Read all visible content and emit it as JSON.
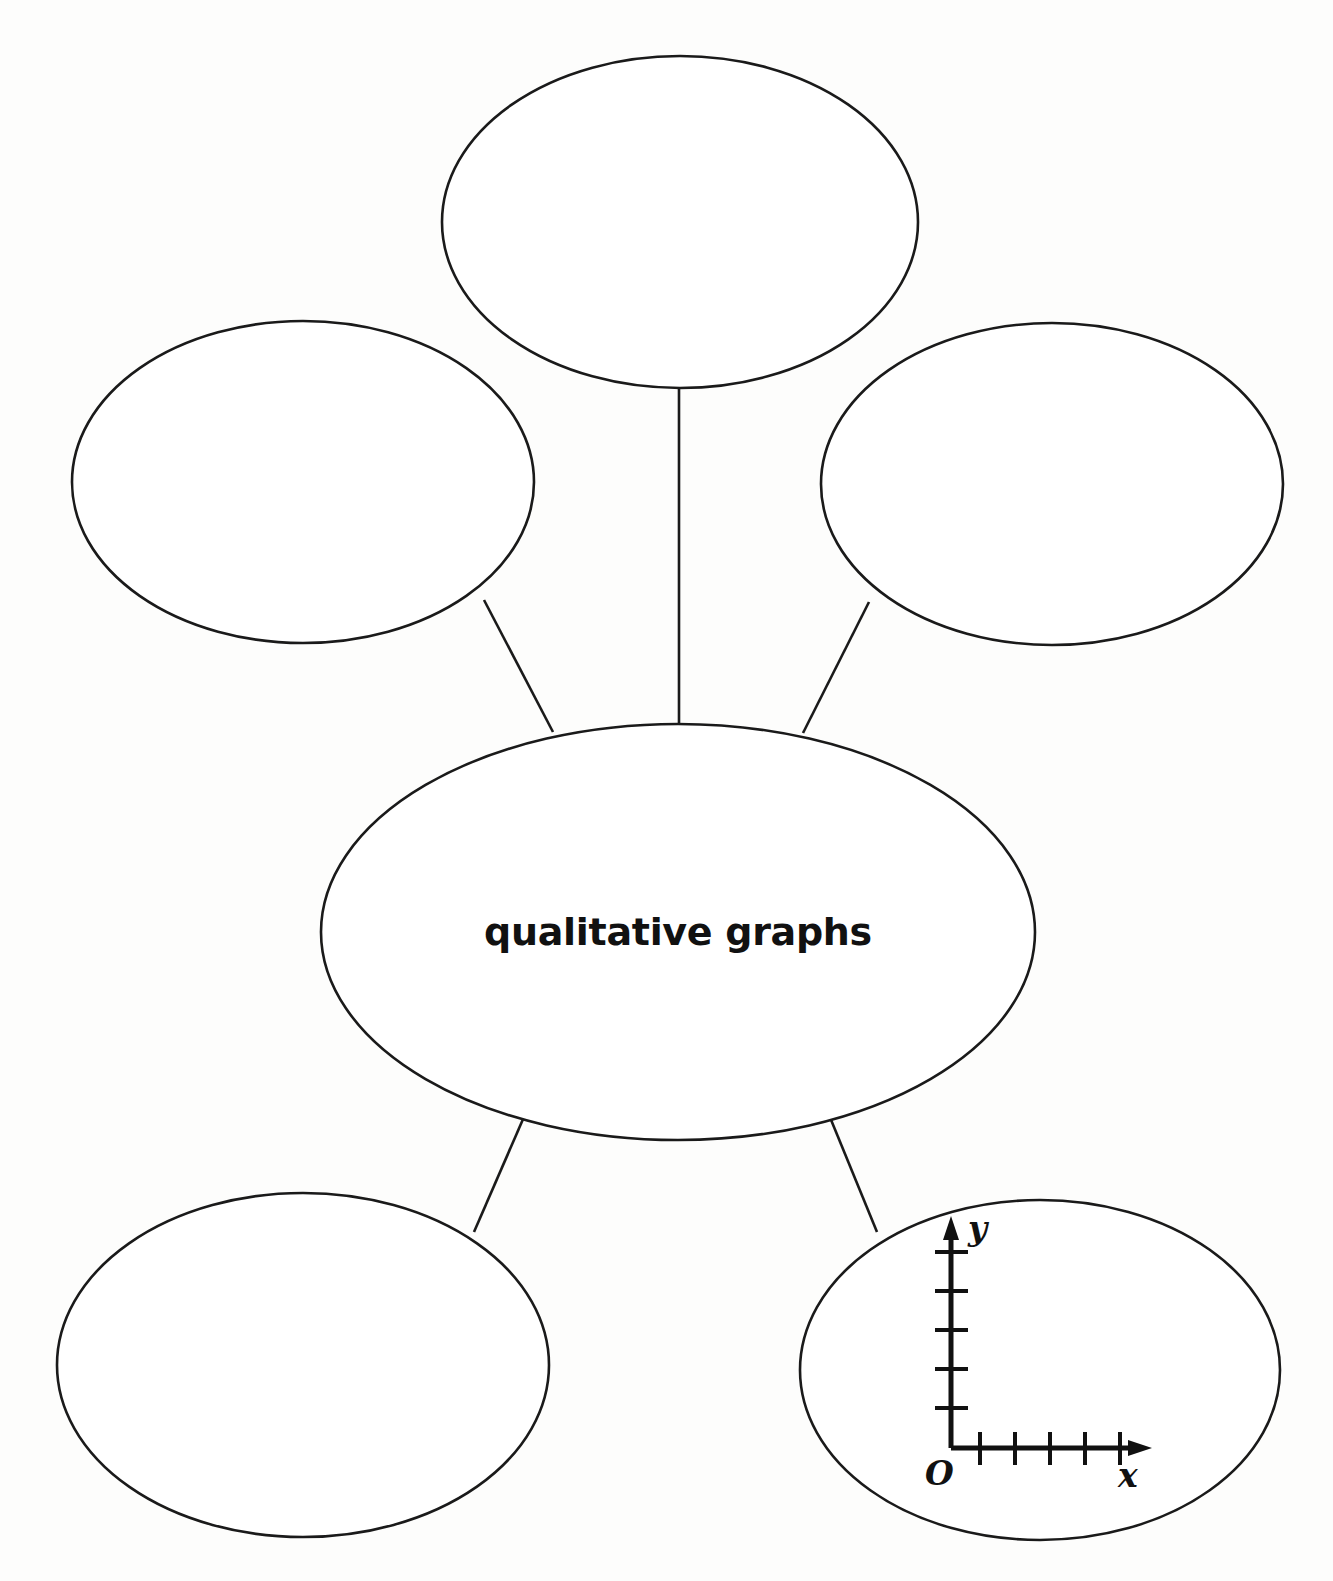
{
  "diagram": {
    "type": "bubble-concept-map",
    "title_bubble": {
      "label": "qualitative graphs",
      "position": "center",
      "cx": 678,
      "cy": 932,
      "rx": 357,
      "ry": 208
    },
    "satellite_bubbles": [
      {
        "id": "top",
        "label": "",
        "cx": 680,
        "cy": 222,
        "rx": 238,
        "ry": 166
      },
      {
        "id": "upper-left",
        "label": "",
        "cx": 303,
        "cy": 482,
        "rx": 231,
        "ry": 161
      },
      {
        "id": "upper-right",
        "label": "",
        "cx": 1052,
        "cy": 484,
        "rx": 231,
        "ry": 161
      },
      {
        "id": "lower-left",
        "label": "",
        "cx": 303,
        "cy": 1365,
        "rx": 246,
        "ry": 172
      },
      {
        "id": "lower-right",
        "label": "",
        "cx": 1040,
        "cy": 1370,
        "rx": 240,
        "ry": 170
      }
    ],
    "connectors": [
      {
        "from": "center",
        "to": "top"
      },
      {
        "from": "center",
        "to": "upper-left"
      },
      {
        "from": "center",
        "to": "upper-right"
      },
      {
        "from": "center",
        "to": "lower-left"
      },
      {
        "from": "center",
        "to": "lower-right"
      }
    ],
    "inset_graph": {
      "inside_bubble": "lower-right",
      "x_axis_label": "x",
      "y_axis_label": "y",
      "origin_label": "O",
      "x_tick_count": 5,
      "y_tick_count": 5,
      "has_arrowheads": true
    },
    "colors": {
      "stroke": "#1a1a1a",
      "text": "#111111",
      "background": "#fdfdfc",
      "bubble_fill": "#ffffff"
    }
  }
}
